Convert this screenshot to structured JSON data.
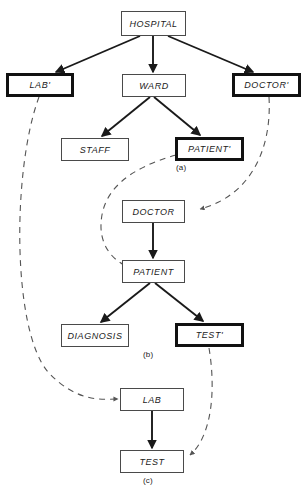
{
  "figure": {
    "captions": [
      {
        "id": "caption-a",
        "text": "(a)",
        "x": 176,
        "y": 163
      },
      {
        "id": "caption-b",
        "text": "(b)",
        "x": 143,
        "y": 350
      },
      {
        "id": "caption-c",
        "text": "(c)",
        "x": 143,
        "y": 476
      }
    ],
    "colors": {
      "box_border": "#4a4a4a",
      "box_border_thick": "#111111",
      "line": "#1a1a1a",
      "dashed_line": "#555555",
      "background": "#ffffff",
      "text": "#1a1a1a"
    }
  },
  "nodes": [
    {
      "id": "hospital",
      "label": "HOSPITAL",
      "tree": "a",
      "thick": false,
      "x": 121,
      "y": 11,
      "w": 65,
      "h": 25
    },
    {
      "id": "lab-prime",
      "label": "LAB'",
      "tree": "a",
      "thick": true,
      "x": 6,
      "y": 73,
      "w": 68,
      "h": 24
    },
    {
      "id": "ward",
      "label": "WARD",
      "tree": "a",
      "thick": false,
      "x": 122,
      "y": 74,
      "w": 64,
      "h": 23
    },
    {
      "id": "doctor-prime",
      "label": "DOCTOR'",
      "tree": "a",
      "thick": true,
      "x": 232,
      "y": 73,
      "w": 69,
      "h": 24
    },
    {
      "id": "staff",
      "label": "STAFF",
      "tree": "a",
      "thick": false,
      "x": 61,
      "y": 138,
      "w": 68,
      "h": 23
    },
    {
      "id": "patient-prime",
      "label": "PATIENT'",
      "tree": "a",
      "thick": true,
      "x": 175,
      "y": 137,
      "w": 69,
      "h": 24
    },
    {
      "id": "doctor",
      "label": "DOCTOR",
      "tree": "b",
      "thick": false,
      "x": 122,
      "y": 200,
      "w": 63,
      "h": 23
    },
    {
      "id": "patient",
      "label": "PATIENT",
      "tree": "b",
      "thick": false,
      "x": 122,
      "y": 260,
      "w": 63,
      "h": 23
    },
    {
      "id": "diagnosis",
      "label": "DIAGNOSIS",
      "tree": "b",
      "thick": false,
      "x": 61,
      "y": 324,
      "w": 68,
      "h": 23
    },
    {
      "id": "test-prime",
      "label": "TEST'",
      "tree": "b",
      "thick": true,
      "x": 175,
      "y": 323,
      "w": 69,
      "h": 24
    },
    {
      "id": "lab",
      "label": "LAB",
      "tree": "c",
      "thick": false,
      "x": 120,
      "y": 388,
      "w": 64,
      "h": 23
    },
    {
      "id": "test",
      "label": "TEST",
      "tree": "c",
      "thick": false,
      "x": 120,
      "y": 450,
      "w": 64,
      "h": 23
    }
  ],
  "solid_edges": [
    {
      "id": "hospital-to-lab-prime",
      "from": "hospital",
      "to": "lab-prime",
      "d": "M 140,36 L 56,72"
    },
    {
      "id": "hospital-to-ward",
      "from": "hospital",
      "to": "ward",
      "d": "M 153,36 L 153,72"
    },
    {
      "id": "hospital-to-doctor-prime",
      "from": "hospital",
      "to": "doctor-prime",
      "d": "M 168,36 L 253,72"
    },
    {
      "id": "ward-to-staff",
      "from": "ward",
      "to": "staff",
      "d": "M 150,97 L 102,136"
    },
    {
      "id": "ward-to-patient-prime",
      "from": "ward",
      "to": "patient-prime",
      "d": "M 154,97 L 200,135"
    },
    {
      "id": "doctor-to-patient",
      "from": "doctor",
      "to": "patient",
      "d": "M 153,223 L 153,258"
    },
    {
      "id": "patient-to-diagnosis",
      "from": "patient",
      "to": "diagnosis",
      "d": "M 150,283 L 101,322"
    },
    {
      "id": "patient-to-test-prime",
      "from": "patient",
      "to": "test-prime",
      "d": "M 155,283 L 203,321"
    },
    {
      "id": "lab-to-test",
      "from": "lab",
      "to": "test",
      "d": "M 152,411 L 152,448"
    }
  ],
  "dashed_edges": [
    {
      "id": "lab-prime-to-lab",
      "from": "lab-prime",
      "to": "lab",
      "d": "M 39,97 C 12,170 12,330 48,372 C 78,404 104,399 118,399"
    },
    {
      "id": "doctor-prime-to-doctor",
      "from": "doctor-prime",
      "to": "doctor",
      "d": "M 269,97 C 272,150 250,196 200,209"
    },
    {
      "id": "patient-prime-to-patient",
      "from": "patient-prime",
      "to": "patient",
      "d": "M 176,155 C 130,168 100,190 101,228 C 102,252 119,264 131,268"
    },
    {
      "id": "test-prime-to-test",
      "from": "test-prime",
      "to": "test",
      "d": "M 209,348 C 216,390 212,436 190,455"
    }
  ]
}
